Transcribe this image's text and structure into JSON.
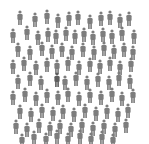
{
  "scene": {
    "description": "Crowd of gray person icons on white background",
    "background": "#ffffff",
    "figure_color": "#7d7d7d",
    "highlight_color": "#5e5e5e",
    "figure_icon": "person-icon"
  },
  "figures": [
    [
      20,
      12
    ],
    [
      35,
      14
    ],
    [
      47,
      11
    ],
    [
      58,
      15
    ],
    [
      69,
      13
    ],
    [
      78,
      12
    ],
    [
      90,
      16
    ],
    [
      101,
      13
    ],
    [
      110,
      12
    ],
    [
      120,
      15
    ],
    [
      129,
      13
    ],
    [
      13,
      30
    ],
    [
      27,
      27
    ],
    [
      38,
      32
    ],
    [
      48,
      29
    ],
    [
      56,
      31
    ],
    [
      66,
      28
    ],
    [
      75,
      31
    ],
    [
      84,
      29
    ],
    [
      93,
      32
    ],
    [
      103,
      29
    ],
    [
      112,
      31
    ],
    [
      122,
      28
    ],
    [
      134,
      31
    ],
    [
      18,
      44
    ],
    [
      30,
      47
    ],
    [
      42,
      43
    ],
    [
      52,
      46
    ],
    [
      62,
      44
    ],
    [
      72,
      47
    ],
    [
      83,
      44
    ],
    [
      94,
      47
    ],
    [
      104,
      43
    ],
    [
      114,
      46
    ],
    [
      124,
      44
    ],
    [
      133,
      47
    ],
    [
      13,
      61
    ],
    [
      24,
      58
    ],
    [
      36,
      62
    ],
    [
      47,
      59
    ],
    [
      57,
      61
    ],
    [
      68,
      58
    ],
    [
      79,
      62
    ],
    [
      90,
      59
    ],
    [
      100,
      61
    ],
    [
      110,
      58
    ],
    [
      120,
      62
    ],
    [
      131,
      59
    ],
    [
      18,
      76
    ],
    [
      30,
      73
    ],
    [
      41,
      77
    ],
    [
      57,
      74,
      1
    ],
    [
      65,
      77
    ],
    [
      76,
      73
    ],
    [
      87,
      77
    ],
    [
      98,
      74
    ],
    [
      109,
      77
    ],
    [
      119,
      73
    ],
    [
      130,
      76
    ],
    [
      13,
      92
    ],
    [
      25,
      89
    ],
    [
      36,
      93
    ],
    [
      47,
      90
    ],
    [
      58,
      92
    ],
    [
      68,
      89
    ],
    [
      79,
      93
    ],
    [
      90,
      90
    ],
    [
      101,
      92
    ],
    [
      112,
      89
    ],
    [
      122,
      93
    ],
    [
      133,
      90
    ],
    [
      20,
      106
    ],
    [
      31,
      109
    ],
    [
      42,
      105
    ],
    [
      53,
      108
    ],
    [
      63,
      106
    ],
    [
      74,
      109
    ],
    [
      85,
      105
    ],
    [
      96,
      108
    ],
    [
      107,
      106
    ],
    [
      118,
      109
    ],
    [
      128,
      105
    ],
    [
      16,
      121
    ],
    [
      27,
      124
    ],
    [
      39,
      120
    ],
    [
      50,
      123
    ],
    [
      60,
      121
    ],
    [
      71,
      124
    ],
    [
      82,
      120
    ],
    [
      93,
      123
    ],
    [
      104,
      121
    ],
    [
      115,
      124
    ],
    [
      126,
      120
    ],
    [
      22,
      135
    ],
    [
      34,
      132
    ],
    [
      46,
      134
    ],
    [
      57,
      131
    ],
    [
      68,
      134
    ],
    [
      80,
      131
    ],
    [
      91,
      134
    ],
    [
      102,
      132
    ],
    [
      113,
      135
    ]
  ]
}
